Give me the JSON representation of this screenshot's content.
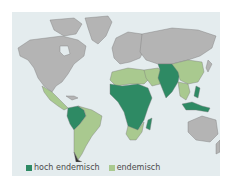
{
  "map": {
    "title": "",
    "colors": {
      "ocean": "#e4ecee",
      "land": "#b4b4b4",
      "border": "#7a7a7a",
      "highly_endemic": "#2e8a64",
      "endemic": "#a9c98f"
    }
  },
  "legend": {
    "items": [
      {
        "label": "hoch endemisch",
        "color": "#2e8a64"
      },
      {
        "label": "endemisch",
        "color": "#a9c98f"
      }
    ]
  }
}
